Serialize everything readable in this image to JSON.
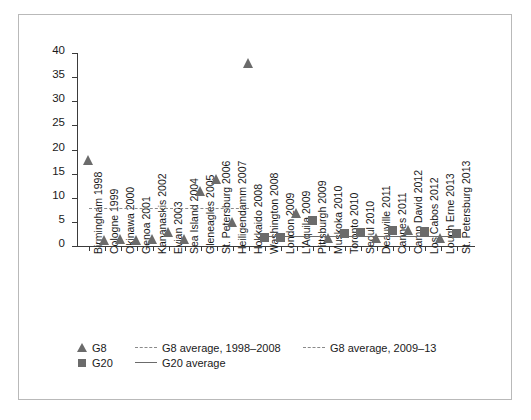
{
  "chart_data": {
    "type": "scatter",
    "title": "",
    "xlabel": "",
    "ylabel": "",
    "ylim": [
      0,
      40
    ],
    "yticks": [
      0,
      5,
      10,
      15,
      20,
      25,
      30,
      35,
      40
    ],
    "grid": false,
    "legend_position": "below-axis",
    "categories": [
      "Birmingham 1998",
      "Cologne 1999",
      "Okinawa 2000",
      "Genoa 2001",
      "Kananaskis 2002",
      "Evian 2003",
      "Sea Island 2004",
      "Gleneagles 2005",
      "St. Petersburg 2006",
      "Heiligendamm 2007",
      "Hokkaido 2008",
      "Washington 2008",
      "London 2009",
      "L'Aquila 2009",
      "Pittsburgh 2009",
      "Muskoka 2010",
      "Toronto 2010",
      "Seoul 2010",
      "Deauville 2011",
      "Cannes 2011",
      "Camp David 2012",
      "Los Cabos 2012",
      "Lough Erne 2013",
      "St. Petersburg 2013"
    ],
    "series": [
      {
        "name": "G8",
        "marker": "triangle",
        "color": "#6b6b6b",
        "points": [
          {
            "category": "Birmingham 1998",
            "value": 17
          },
          {
            "category": "Cologne 1999",
            "value": 0.5
          },
          {
            "category": "Okinawa 2000",
            "value": 0.6
          },
          {
            "category": "Genoa 2001",
            "value": 0.5
          },
          {
            "category": "Kananaskis 2002",
            "value": 0.6
          },
          {
            "category": "Evian 2003",
            "value": 2
          },
          {
            "category": "Sea Island 2004",
            "value": 0.6
          },
          {
            "category": "Gleneagles 2005",
            "value": 10.5
          },
          {
            "category": "St. Petersburg 2006",
            "value": 13
          },
          {
            "category": "Heiligendamm 2007",
            "value": 4.2
          },
          {
            "category": "Hokkaido 2008",
            "value": 37
          },
          {
            "category": "L'Aquila 2009",
            "value": 6
          },
          {
            "category": "Muskoka 2010",
            "value": 0.8
          },
          {
            "category": "Deauville 2011",
            "value": 0.8
          },
          {
            "category": "Camp David 2012",
            "value": 2.4
          },
          {
            "category": "Lough Erne 2013",
            "value": 0.8
          }
        ]
      },
      {
        "name": "G20",
        "marker": "square",
        "color": "#6b6b6b",
        "points": [
          {
            "category": "Washington 2008",
            "value": 1.2
          },
          {
            "category": "London 2009",
            "value": 1.3
          },
          {
            "category": "Pittsburgh 2009",
            "value": 4.7
          },
          {
            "category": "Toronto 2010",
            "value": 2.0
          },
          {
            "category": "Seoul 2010",
            "value": 2.2
          },
          {
            "category": "Cannes 2011",
            "value": 2.6
          },
          {
            "category": "Los Cabos 2012",
            "value": 2.4
          },
          {
            "category": "St. Petersburg 2013",
            "value": 2.0
          }
        ]
      }
    ],
    "reference_lines": [
      {
        "name": "G8 average, 1998-2008",
        "style": "dashed",
        "color": "#8a8a8a",
        "value": 7.8,
        "from_category": "Birmingham 1998",
        "to_category": "Hokkaido 2008"
      },
      {
        "name": "G8 average, 2009-13",
        "style": "dashed",
        "color": "#8a8a8a",
        "value": 2.1,
        "from_category": "London 2009",
        "to_category": "St. Petersburg 2013"
      },
      {
        "name": "G20 average",
        "style": "solid",
        "color": "#6b6b6b",
        "value": 2.0,
        "from_category": "Washington 2008",
        "to_category": "St. Petersburg 2013"
      }
    ]
  },
  "legend": {
    "g8_marker_label": "G8",
    "g8_avg_1_label": "G8 average, 1998–2008",
    "g8_avg_2_label": "G8 average, 2009–13",
    "g20_marker_label": "G20",
    "g20_avg_label": "G20 average"
  }
}
